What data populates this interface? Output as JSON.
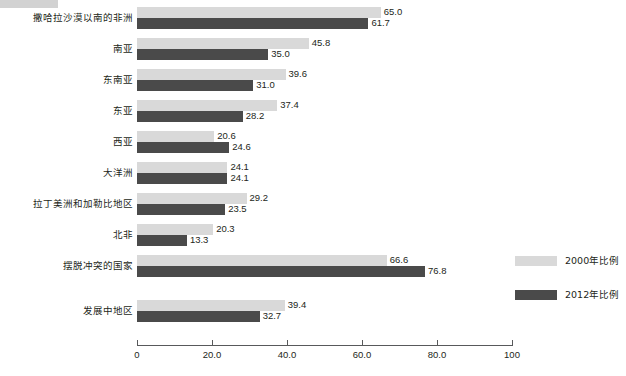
{
  "redaction": {
    "name": "redacted-title-strip",
    "color": "#d2d2d2"
  },
  "legend": {
    "position": "right",
    "items": [
      {
        "label": "2000年比例",
        "color": "#d9d9d9"
      },
      {
        "label": "2012年比例",
        "color": "#4a4a4a"
      }
    ]
  },
  "axis": {
    "ticks": [
      "0",
      "20.0",
      "40.0",
      "60.0",
      "80.0",
      "100"
    ],
    "tick_values": [
      0,
      20,
      40,
      60,
      80,
      100
    ]
  },
  "chart_data": {
    "type": "bar",
    "orientation": "horizontal",
    "title": "",
    "subtitle": "",
    "xlabel": "",
    "ylabel": "",
    "xlim": [
      0,
      100
    ],
    "grid": false,
    "legend_position": "right",
    "categories": [
      "撒哈拉沙漠以南的非洲",
      "南亚",
      "东南亚",
      "东亚",
      "西亚",
      "大洋洲",
      "拉丁美洲和加勒比地区",
      "北非",
      "摆脱冲突的国家",
      "发展中地区"
    ],
    "series": [
      {
        "name": "2000年比例",
        "color": "#d9d9d9",
        "values": [
          65.0,
          45.8,
          39.6,
          37.4,
          20.6,
          24.1,
          29.2,
          20.3,
          66.6,
          39.4
        ],
        "labels": [
          "65.0",
          "45.8",
          "39.6",
          "37.4",
          "20.6",
          "24.1",
          "29.2",
          "20.3",
          "66.6",
          "39.4"
        ]
      },
      {
        "name": "2012年比例",
        "color": "#4a4a4a",
        "values": [
          61.7,
          35.0,
          31.0,
          28.2,
          24.6,
          24.1,
          23.5,
          13.3,
          76.8,
          32.7
        ],
        "labels": [
          "61.7",
          "35.0",
          "31.0",
          "28.2",
          "24.6",
          "24.1",
          "23.5",
          "13.3",
          "76.8",
          "32.7"
        ]
      }
    ]
  }
}
